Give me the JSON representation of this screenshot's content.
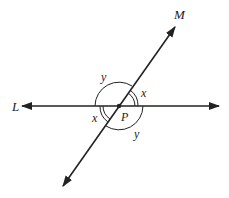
{
  "diagram": {
    "lines": [
      {
        "name": "L",
        "label": "L",
        "type": "horizontal line with arrows at both ends"
      },
      {
        "name": "M",
        "label": "M",
        "type": "oblique line with arrows at both ends"
      }
    ],
    "intersection": {
      "label": "P"
    },
    "angles": [
      {
        "label": "x",
        "position": "upper-right",
        "marker": "double arc"
      },
      {
        "label": "y",
        "position": "upper-left",
        "marker": "single arc"
      },
      {
        "label": "x",
        "position": "lower-left",
        "marker": "double arc"
      },
      {
        "label": "y",
        "position": "lower-right",
        "marker": "single arc"
      }
    ],
    "colors": {
      "stroke": "#222222",
      "background": "#ffffff"
    }
  }
}
